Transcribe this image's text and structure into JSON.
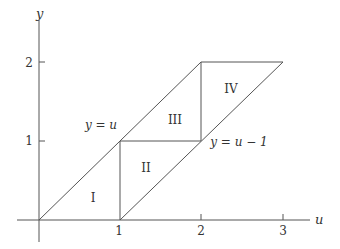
{
  "diagram": {
    "axes": {
      "x_label": "u",
      "y_label": "y",
      "x_ticks": [
        "1",
        "2",
        "3"
      ],
      "y_ticks": [
        "1",
        "2"
      ]
    },
    "lines": {
      "upper": "y = u",
      "lower": "y = u − 1"
    },
    "regions": [
      "I",
      "II",
      "III",
      "IV"
    ],
    "colors": {
      "line": "#555555",
      "text": "#333333"
    }
  }
}
